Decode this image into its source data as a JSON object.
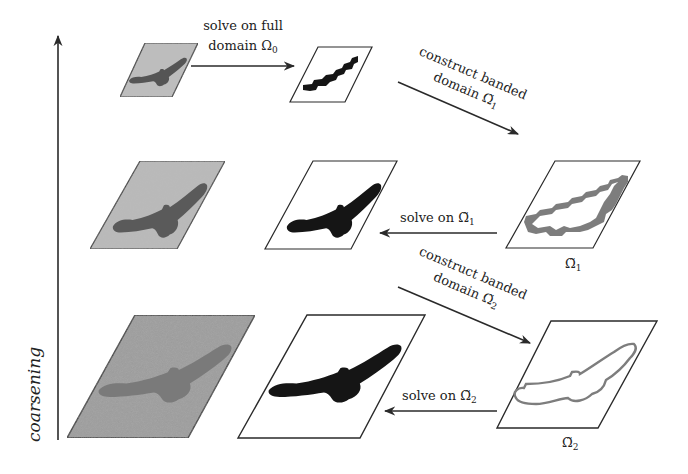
{
  "axis": {
    "label": "coarsening",
    "direction": "up"
  },
  "colors": {
    "frame": "#2a2a2a",
    "noisy_bg_top": "#bdbdbd",
    "noisy_bg_mid": "#b9b9b9",
    "noisy_bg_bottom": "#9a9a9a",
    "noisy_bird_top": "#555555",
    "noisy_bird_mid": "#5a5a5a",
    "noisy_bird_bottom": "#7a7a7a",
    "solved_bird": "#151515",
    "band": "#7d7d7d",
    "arrow": "#2a2a2a"
  },
  "rows": [
    {
      "level": "coarsest",
      "panels": [
        {
          "name": "noisy-input",
          "type": "noisy"
        },
        {
          "name": "segmentation",
          "type": "solved"
        }
      ],
      "arrows": [
        {
          "name": "solve-full-arrow",
          "label_line1": "solve on full",
          "label_line2_text": "domain ",
          "label_line2_symbol": "Ω",
          "label_line2_sub": "0"
        }
      ]
    },
    {
      "level": "middle",
      "panels": [
        {
          "name": "noisy-input",
          "type": "noisy"
        },
        {
          "name": "segmentation",
          "type": "solved"
        },
        {
          "name": "banded-domain",
          "type": "band",
          "caption_symbol": "Ω̃",
          "caption_sub": "1"
        }
      ],
      "arrows": [
        {
          "name": "construct-band-arrow",
          "label_line1": "construct banded",
          "label_line2_text": "domain ",
          "label_line2_symbol": "Ω̃",
          "label_line2_sub": "1"
        },
        {
          "name": "solve-band-arrow",
          "label_text": "solve on ",
          "label_symbol": "Ω̃",
          "label_sub": "1"
        }
      ]
    },
    {
      "level": "finest",
      "panels": [
        {
          "name": "noisy-input",
          "type": "noisy"
        },
        {
          "name": "segmentation",
          "type": "solved"
        },
        {
          "name": "banded-domain",
          "type": "band",
          "caption_symbol": "Ω̃",
          "caption_sub": "2"
        }
      ],
      "arrows": [
        {
          "name": "construct-band-arrow",
          "label_line1": "construct banded",
          "label_line2_text": "domain ",
          "label_line2_symbol": "Ω̃",
          "label_line2_sub": "2"
        },
        {
          "name": "solve-band-arrow",
          "label_text": "solve on ",
          "label_symbol": "Ω̃",
          "label_sub": "2"
        }
      ]
    }
  ]
}
